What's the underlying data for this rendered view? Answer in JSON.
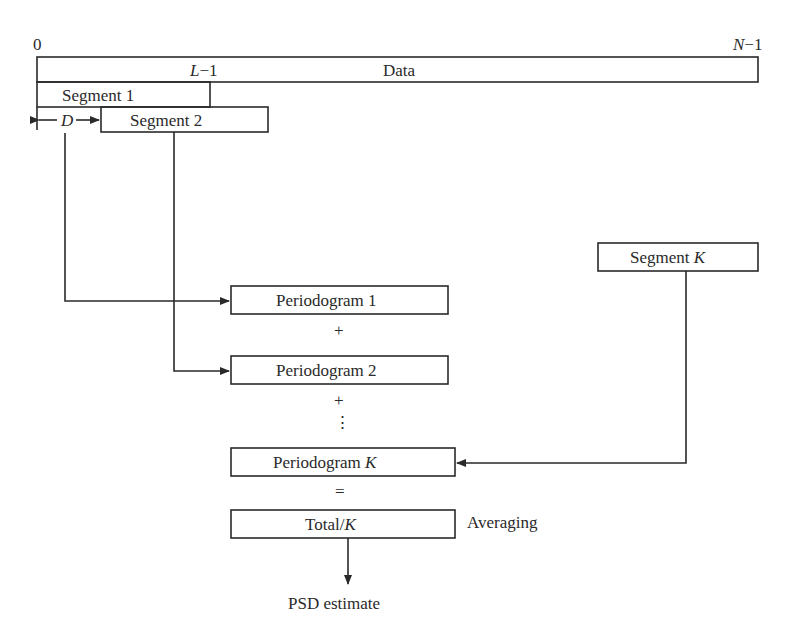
{
  "diagram": {
    "top_axis": {
      "start_label": "0",
      "end_label_var": "N",
      "end_label_suffix": "−1"
    },
    "data_bar": {
      "label": "Data",
      "marker_var": "L",
      "marker_suffix": "−1"
    },
    "segments": [
      {
        "label": "Segment 1"
      },
      {
        "label": "Segment 2"
      },
      {
        "label_prefix": "Segment ",
        "label_var": "K"
      }
    ],
    "offset": {
      "label": "D"
    },
    "periodograms": [
      {
        "label": "Periodogram 1"
      },
      {
        "label": "Periodogram 2"
      },
      {
        "label_prefix": "Periodogram ",
        "label_var": "K"
      }
    ],
    "operators": {
      "plus1": "+",
      "plus2": "+",
      "ellipsis": "⋮",
      "equals": "="
    },
    "total": {
      "label_prefix": "Total/",
      "label_var": "K"
    },
    "averaging_label": "Averaging",
    "output_label": "PSD estimate",
    "colors": {
      "line": "#2a2a2a",
      "background": "#ffffff"
    }
  }
}
